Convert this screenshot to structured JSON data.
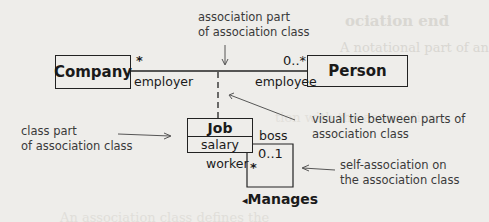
{
  "diagram": {
    "type": "UML association class",
    "classes": {
      "company": {
        "name": "Company"
      },
      "person": {
        "name": "Person"
      },
      "job": {
        "name": "Job",
        "attribute": "salary"
      }
    },
    "association": {
      "company_end": {
        "multiplicity": "*",
        "role": "employer"
      },
      "person_end": {
        "multiplicity": "0..*",
        "role": "employee"
      }
    },
    "self_association": {
      "name": "Manages",
      "direction_glyph": "◂",
      "boss_end": {
        "role": "boss",
        "multiplicity": "0..1"
      },
      "worker_end": {
        "role": "worker",
        "multiplicity": "*"
      }
    },
    "annotations": {
      "association_part": [
        "association part",
        "of association class"
      ],
      "class_part": [
        "class part",
        "of association class"
      ],
      "visual_tie": [
        "visual tie between parts of",
        "association class"
      ],
      "self_assoc": [
        "self-association on",
        "the association class"
      ]
    },
    "background_bleed_text": [
      "ociation end",
      "A notational part of an association...",
      "association ... more common",
      "tion. The ... options",
      "itions, and ... are not",
      "... with ... "
    ]
  },
  "colors": {
    "background": "#eeedea",
    "ink": "#1a1a1a",
    "note": "#3a3a3a"
  }
}
